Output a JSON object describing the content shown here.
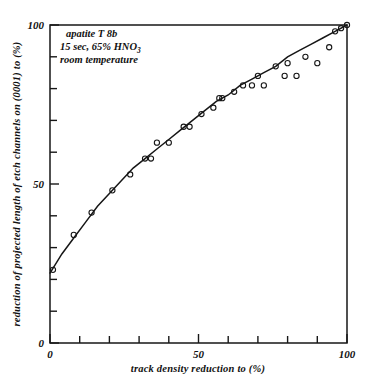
{
  "chart_data": {
    "type": "scatter",
    "title": "",
    "xlabel": "track  density  reduction  to  (%)",
    "ylabel": "reduction of projected length of etch channels on (0001) to (%)",
    "xlim": [
      0,
      100
    ],
    "ylim": [
      0,
      100
    ],
    "grid": false,
    "legend": null,
    "x_tick_labels": [
      "0",
      "50",
      "100"
    ],
    "y_tick_labels": [
      "0",
      "50",
      "100"
    ],
    "x_major_ticks": [
      0,
      50,
      100
    ],
    "y_major_ticks": [
      0,
      50,
      100
    ],
    "x_minor_tick_step": 10,
    "y_minor_tick_step": 10,
    "annotation": {
      "line1": "apatite T 8b",
      "line2_pre": "15 sec, 65% HNO",
      "line2_sub": "3",
      "line3": "room temperature"
    },
    "series": [
      {
        "name": "measured etch channel length reduction",
        "marker": "open-circle",
        "points": [
          [
            1,
            23
          ],
          [
            8,
            34
          ],
          [
            14,
            41
          ],
          [
            21,
            48
          ],
          [
            27,
            53
          ],
          [
            32,
            58
          ],
          [
            34,
            58
          ],
          [
            36,
            63
          ],
          [
            40,
            63
          ],
          [
            45,
            68
          ],
          [
            47,
            68
          ],
          [
            51,
            72
          ],
          [
            55,
            74
          ],
          [
            57,
            77
          ],
          [
            58,
            77
          ],
          [
            62,
            79
          ],
          [
            65,
            81
          ],
          [
            68,
            81
          ],
          [
            70,
            84
          ],
          [
            72,
            81
          ],
          [
            76,
            87
          ],
          [
            79,
            84
          ],
          [
            80,
            88
          ],
          [
            83,
            84
          ],
          [
            86,
            90
          ],
          [
            90,
            88
          ],
          [
            94,
            93
          ],
          [
            96,
            98
          ],
          [
            98,
            99
          ],
          [
            100,
            100
          ]
        ]
      }
    ],
    "fit_curve": {
      "name": "fitted trend line",
      "points": [
        [
          0,
          22
        ],
        [
          4,
          28
        ],
        [
          8,
          33
        ],
        [
          12,
          38
        ],
        [
          16,
          43
        ],
        [
          20,
          47
        ],
        [
          24,
          51
        ],
        [
          28,
          55
        ],
        [
          32,
          58
        ],
        [
          36,
          61
        ],
        [
          40,
          64
        ],
        [
          44,
          67
        ],
        [
          48,
          70
        ],
        [
          52,
          73
        ],
        [
          56,
          76
        ],
        [
          60,
          78
        ],
        [
          64,
          81
        ],
        [
          68,
          83
        ],
        [
          72,
          85
        ],
        [
          76,
          87
        ],
        [
          80,
          90
        ],
        [
          84,
          92
        ],
        [
          88,
          94
        ],
        [
          92,
          96
        ],
        [
          96,
          98
        ],
        [
          100,
          100
        ]
      ]
    }
  }
}
